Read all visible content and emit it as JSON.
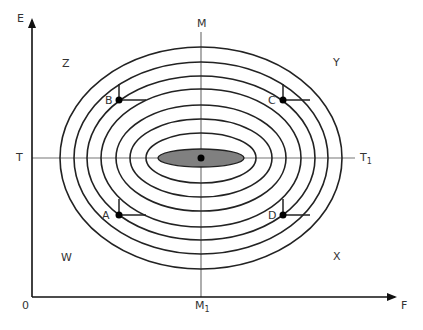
{
  "diagram": {
    "type": "indifference-map / concentric iso-curves",
    "axes": {
      "y_label": "E",
      "x_label": "F",
      "origin_label": "0",
      "vertical_line_top_label": "M",
      "vertical_line_bottom_label": "M",
      "vertical_line_bottom_subscript": "1",
      "horizontal_line_left_label": "T",
      "horizontal_line_right_label": "T",
      "horizontal_line_right_subscript": "1"
    },
    "quadrant_labels": {
      "top_left": "Z",
      "top_right": "Y",
      "bottom_left": "W",
      "bottom_right": "X"
    },
    "points": [
      {
        "label": "B",
        "x": 119,
        "y": 100
      },
      {
        "label": "C",
        "x": 283,
        "y": 100
      },
      {
        "label": "A",
        "x": 119,
        "y": 215
      },
      {
        "label": "D",
        "x": 283,
        "y": 215
      }
    ],
    "center": {
      "x": 201,
      "y": 158
    },
    "ellipses": [
      {
        "rx": 141,
        "ry": 111
      },
      {
        "rx": 127,
        "ry": 96
      },
      {
        "rx": 114,
        "ry": 82
      },
      {
        "rx": 100,
        "ry": 69
      },
      {
        "rx": 85,
        "ry": 53
      },
      {
        "rx": 71,
        "ry": 39
      },
      {
        "rx": 55,
        "ry": 25
      }
    ],
    "shaded_ellipse": {
      "rx": 43,
      "ry": 9,
      "fill": "#808080"
    },
    "colors": {
      "curve": "#222222",
      "axis": "#222222",
      "guide": "#777777",
      "shade": "#808080"
    }
  }
}
